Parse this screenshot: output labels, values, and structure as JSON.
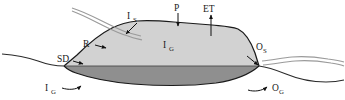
{
  "figure": {
    "type": "hydrologic-water-balance-cross-section",
    "title": "",
    "background_color": "#ffffff"
  },
  "colors": {
    "outline": "#1a1a1a",
    "unsaturated_fill": "#d2d2d2",
    "saturated_fill": "#8f8f8f",
    "stream_line": "#9a9a9a",
    "ground_line": "#2a2a2a",
    "label_text": "#1a1a1a"
  },
  "labels": {
    "inflow_surface": {
      "base": "I",
      "sub": "S",
      "full": "IS"
    },
    "precipitation": {
      "base": "P",
      "sub": "",
      "full": "P"
    },
    "evapotranspiration": {
      "base": "ET",
      "sub": "",
      "full": "ET"
    },
    "runoff": {
      "base": "R",
      "sub": "",
      "full": "R"
    },
    "surface_depression": {
      "base": "SD",
      "sub": "",
      "full": "SD"
    },
    "storage_groundwater_center": {
      "base": "I",
      "sub": "G",
      "full": "IG"
    },
    "inflow_groundwater": {
      "base": "I",
      "sub": "G",
      "full": "IG"
    },
    "outflow_surface": {
      "base": "O",
      "sub": "S",
      "full": "OS"
    },
    "outflow_groundwater": {
      "base": "O",
      "sub": "G",
      "full": "OG"
    }
  },
  "flows": [
    {
      "name": "inflow-surface",
      "symbol": "IS",
      "direction": "into-wetland",
      "arrow": "down-right"
    },
    {
      "name": "precipitation",
      "symbol": "P",
      "direction": "downward",
      "arrow": "down"
    },
    {
      "name": "evapotranspiration",
      "symbol": "ET",
      "direction": "upward",
      "arrow": "up"
    },
    {
      "name": "runoff",
      "symbol": "R",
      "direction": "into-wetland",
      "arrow": "right"
    },
    {
      "name": "surface-depression",
      "symbol": "SD",
      "direction": "pointer",
      "arrow": "right"
    },
    {
      "name": "inflow-groundwater",
      "symbol": "IG",
      "direction": "into-wetland",
      "arrow": "up-right"
    },
    {
      "name": "outflow-surface",
      "symbol": "OS",
      "direction": "out-of-wetland",
      "arrow": "down-right"
    },
    {
      "name": "outflow-groundwater",
      "symbol": "OG",
      "direction": "out-of-wetland",
      "arrow": "up-right"
    }
  ]
}
